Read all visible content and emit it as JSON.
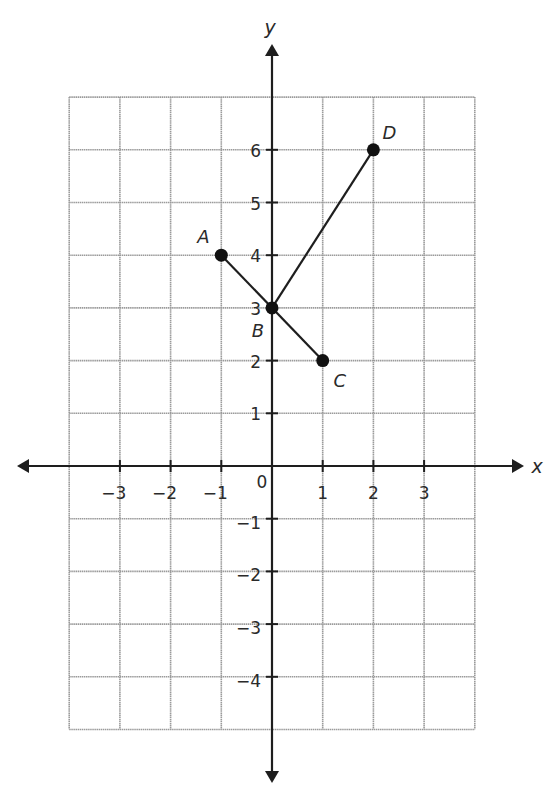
{
  "chart_data": {
    "type": "scatter",
    "title": "",
    "xlabel": "x",
    "ylabel": "y",
    "xlim": [
      -4,
      4
    ],
    "ylim": [
      -5,
      7
    ],
    "grid": true,
    "x_ticks": [
      -3,
      -2,
      -1,
      1,
      2,
      3
    ],
    "y_ticks": [
      -4,
      -3,
      -2,
      -1,
      1,
      2,
      3,
      4,
      5,
      6
    ],
    "origin_label": "0",
    "points": [
      {
        "name": "A",
        "x": -1,
        "y": 4
      },
      {
        "name": "B",
        "x": 0,
        "y": 3
      },
      {
        "name": "C",
        "x": 1,
        "y": 2
      },
      {
        "name": "D",
        "x": 2,
        "y": 6
      }
    ],
    "segments": [
      {
        "from": "A",
        "to": "C"
      },
      {
        "from": "B",
        "to": "D"
      }
    ]
  },
  "colors": {
    "grid": "#9a9a9a",
    "axis": "#1e1e1e",
    "point": "#111111"
  }
}
